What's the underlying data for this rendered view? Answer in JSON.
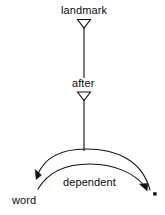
{
  "diagram": {
    "type": "dependency-relation-graph",
    "background_color": "#ffffff",
    "stroke_color": "#111111",
    "text_color": "#0a0a0a",
    "nodes": [
      {
        "id": "landmark",
        "label": "landmark",
        "x": 84,
        "y": 10
      },
      {
        "id": "after",
        "label": "after",
        "x": 84,
        "y": 83
      },
      {
        "id": "dependent",
        "label": "dependent",
        "x": 91,
        "y": 182
      },
      {
        "id": "word",
        "label": "word",
        "x": 28,
        "y": 200
      }
    ],
    "markers": [
      {
        "id": "landmark-arrowhead",
        "shape": "hollow-down-triangle",
        "x": 84,
        "y": 23
      },
      {
        "id": "after-arrowhead",
        "shape": "hollow-down-triangle",
        "x": 84,
        "y": 96
      },
      {
        "id": "word-arrowhead",
        "shape": "filled-arrowhead",
        "x": 36,
        "y": 176
      },
      {
        "id": "right-arrowhead",
        "shape": "filled-arrowhead",
        "x": 145,
        "y": 189
      },
      {
        "id": "right-endpoint-dot",
        "shape": "filled-square-dot",
        "x": 155,
        "y": 194
      }
    ],
    "edges": [
      {
        "id": "landmark-to-after",
        "from": "landmark",
        "to": "after",
        "style": "straight-vertical"
      },
      {
        "id": "after-to-arc",
        "from": "after",
        "to": "arc-apex",
        "style": "straight-vertical"
      },
      {
        "id": "outer-arc",
        "from": "right-endpoint",
        "to": "word",
        "style": "curved-arc",
        "direction": "right-to-left"
      },
      {
        "id": "inner-arc",
        "label": "dependent",
        "from": "word",
        "to": "right-endpoint",
        "style": "curved-arc",
        "direction": "left-to-right"
      }
    ]
  }
}
